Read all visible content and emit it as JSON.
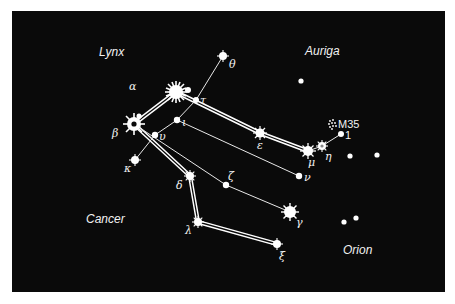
{
  "chart": {
    "background": "#0a0a0a",
    "foreground": "#ffffff"
  },
  "regions": {
    "lynx": "Lynx",
    "auriga": "Auriga",
    "cancer": "Cancer",
    "orion": "Orion"
  },
  "stars": {
    "alpha": "α",
    "beta": "β",
    "gamma": "γ",
    "delta": "δ",
    "epsilon": "ε",
    "zeta": "ζ",
    "eta": "η",
    "theta": "θ",
    "iota": "ι",
    "kappa": "κ",
    "lambda": "λ",
    "mu": "μ",
    "nu": "ν",
    "xi": "ξ",
    "tau": "τ",
    "upsilon": "υ",
    "one": "1"
  },
  "objects": {
    "m35": "M35"
  }
}
